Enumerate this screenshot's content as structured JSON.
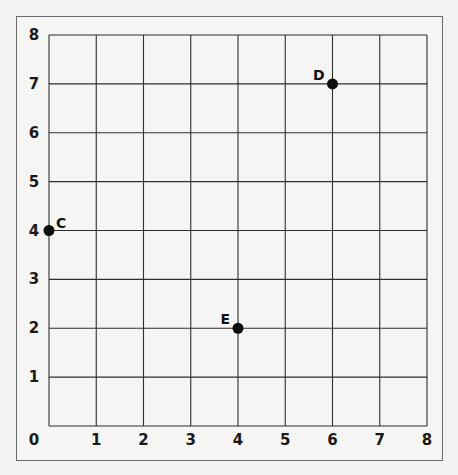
{
  "chart_data": {
    "type": "scatter",
    "title": "",
    "xlabel": "",
    "ylabel": "",
    "xlim": [
      0,
      8
    ],
    "ylim": [
      0,
      8
    ],
    "grid": true,
    "legend": null,
    "x_ticks": [
      0,
      1,
      2,
      3,
      4,
      5,
      6,
      7,
      8
    ],
    "y_ticks": [
      1,
      2,
      3,
      4,
      5,
      6,
      7,
      8
    ],
    "points": [
      {
        "label": "C",
        "x": 0,
        "y": 4
      },
      {
        "label": "D",
        "x": 6,
        "y": 7
      },
      {
        "label": "E",
        "x": 4,
        "y": 2
      }
    ],
    "colors": {
      "grid": "#2e2e2e",
      "points": "#0d0d0d",
      "frame": "#6a6a6a",
      "background": "#f5f5f3"
    }
  }
}
